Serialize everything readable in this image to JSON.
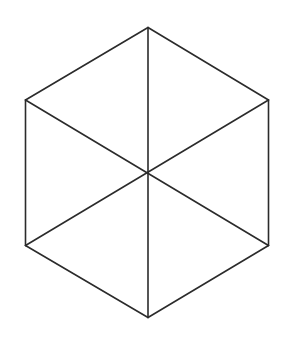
{
  "diagram": {
    "type": "hexagon-with-diagonals",
    "background": "#ffffff",
    "stroke_color": "#2b2b2b",
    "stroke_width": 1.6,
    "center": {
      "x": 148,
      "y": 172.5
    },
    "vertices": {
      "top": {
        "x": 148,
        "y": 27.5
      },
      "upper_right": {
        "x": 268.5,
        "y": 100
      },
      "lower_right": {
        "x": 268.5,
        "y": 245.5
      },
      "bottom": {
        "x": 148,
        "y": 317.5
      },
      "lower_left": {
        "x": 25.5,
        "y": 245.5
      },
      "upper_left": {
        "x": 25.5,
        "y": 100
      }
    },
    "edges": [
      {
        "name": "edge-top-upper-right",
        "from": "top",
        "to": "upper_right"
      },
      {
        "name": "edge-upper-right-lower-right",
        "from": "upper_right",
        "to": "lower_right"
      },
      {
        "name": "edge-lower-right-bottom",
        "from": "lower_right",
        "to": "bottom"
      },
      {
        "name": "edge-bottom-lower-left",
        "from": "bottom",
        "to": "lower_left"
      },
      {
        "name": "edge-lower-left-upper-left",
        "from": "lower_left",
        "to": "upper_left"
      },
      {
        "name": "edge-upper-left-top",
        "from": "upper_left",
        "to": "top"
      }
    ],
    "diagonals": [
      {
        "name": "diagonal-top-bottom",
        "from": "top",
        "to": "bottom"
      },
      {
        "name": "diagonal-upper-left-lower-right",
        "from": "upper_left",
        "to": "lower_right"
      },
      {
        "name": "diagonal-upper-right-lower-left",
        "from": "upper_right",
        "to": "lower_left"
      }
    ]
  }
}
